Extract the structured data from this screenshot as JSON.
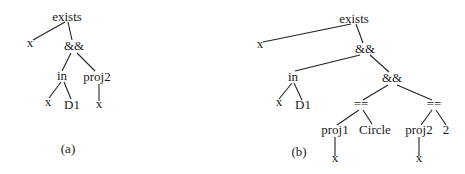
{
  "figure": {
    "colors": {
      "text": "#1a1a1a",
      "edge": "#222222",
      "background": "#ffffff"
    },
    "trees": [
      {
        "id": "a",
        "caption": "(a)",
        "caption_pos": [
          68,
          153
        ],
        "nodes": [
          {
            "id": "a0",
            "label": "exists",
            "x": 67,
            "y": 21
          },
          {
            "id": "a1",
            "label": "x",
            "x": 30,
            "y": 47
          },
          {
            "id": "a2",
            "label": "&&",
            "x": 74,
            "y": 50
          },
          {
            "id": "a3",
            "label": "in",
            "x": 62,
            "y": 80
          },
          {
            "id": "a4",
            "label": "proj2",
            "x": 97,
            "y": 81
          },
          {
            "id": "a5",
            "label": "x",
            "x": 48,
            "y": 106
          },
          {
            "id": "a6",
            "label": "D1",
            "x": 72,
            "y": 109
          },
          {
            "id": "a7",
            "label": "x",
            "x": 99,
            "y": 108
          }
        ],
        "edges": [
          {
            "x1": 65,
            "y1": 22,
            "x2": 33,
            "y2": 40
          },
          {
            "x1": 68,
            "y1": 22,
            "x2": 72,
            "y2": 40
          },
          {
            "x1": 71,
            "y1": 53,
            "x2": 62,
            "y2": 71
          },
          {
            "x1": 77,
            "y1": 53,
            "x2": 95,
            "y2": 71
          },
          {
            "x1": 61,
            "y1": 82,
            "x2": 49,
            "y2": 98
          },
          {
            "x1": 64,
            "y1": 82,
            "x2": 71,
            "y2": 99
          },
          {
            "x1": 99,
            "y1": 84,
            "x2": 99,
            "y2": 101
          }
        ]
      },
      {
        "id": "b",
        "caption": "(b)",
        "caption_pos": [
          299,
          156
        ],
        "nodes": [
          {
            "id": "b0",
            "label": "exists",
            "x": 354,
            "y": 23
          },
          {
            "id": "b1",
            "label": "x",
            "x": 260,
            "y": 48
          },
          {
            "id": "b2",
            "label": "&&",
            "x": 365,
            "y": 53
          },
          {
            "id": "b3",
            "label": "in",
            "x": 293,
            "y": 81
          },
          {
            "id": "b4",
            "label": "&&",
            "x": 392,
            "y": 82
          },
          {
            "id": "b5",
            "label": "x",
            "x": 279,
            "y": 106
          },
          {
            "id": "b6",
            "label": "D1",
            "x": 303,
            "y": 109
          },
          {
            "id": "b7",
            "label": "==",
            "x": 361,
            "y": 108
          },
          {
            "id": "b8",
            "label": "==",
            "x": 434,
            "y": 108
          },
          {
            "id": "b9",
            "label": "proj1",
            "x": 335,
            "y": 134
          },
          {
            "id": "b10",
            "label": "Circle",
            "x": 375,
            "y": 134
          },
          {
            "id": "b11",
            "label": "proj2",
            "x": 419,
            "y": 134
          },
          {
            "id": "b12",
            "label": "2",
            "x": 446,
            "y": 134
          },
          {
            "id": "b13",
            "label": "x",
            "x": 335,
            "y": 162
          },
          {
            "id": "b14",
            "label": "x",
            "x": 419,
            "y": 162
          }
        ],
        "edges": [
          {
            "x1": 351,
            "y1": 24,
            "x2": 263,
            "y2": 42
          },
          {
            "x1": 356,
            "y1": 24,
            "x2": 363,
            "y2": 43
          },
          {
            "x1": 360,
            "y1": 55,
            "x2": 295,
            "y2": 71
          },
          {
            "x1": 370,
            "y1": 55,
            "x2": 389,
            "y2": 72
          },
          {
            "x1": 292,
            "y1": 83,
            "x2": 279,
            "y2": 99
          },
          {
            "x1": 294,
            "y1": 83,
            "x2": 302,
            "y2": 100
          },
          {
            "x1": 388,
            "y1": 85,
            "x2": 363,
            "y2": 100
          },
          {
            "x1": 397,
            "y1": 85,
            "x2": 432,
            "y2": 100
          },
          {
            "x1": 359,
            "y1": 110,
            "x2": 337,
            "y2": 125
          },
          {
            "x1": 363,
            "y1": 110,
            "x2": 372,
            "y2": 124
          },
          {
            "x1": 432,
            "y1": 110,
            "x2": 421,
            "y2": 125
          },
          {
            "x1": 436,
            "y1": 110,
            "x2": 446,
            "y2": 125
          },
          {
            "x1": 335,
            "y1": 137,
            "x2": 335,
            "y2": 156
          },
          {
            "x1": 419,
            "y1": 137,
            "x2": 419,
            "y2": 156
          }
        ]
      }
    ]
  }
}
